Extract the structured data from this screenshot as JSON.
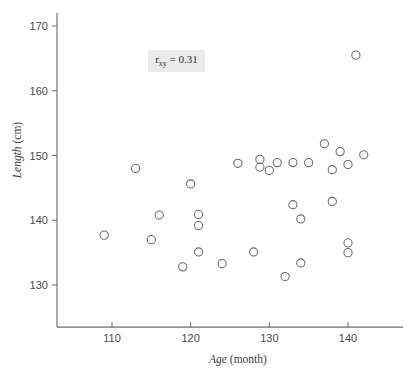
{
  "chart_data": {
    "type": "scatter",
    "title": "",
    "xlabel": "Age (month)",
    "xlabel_italic_part": "Age",
    "xlabel_rest": " (month)",
    "ylabel": "Length (cm)",
    "ylabel_italic_part": "Length",
    "ylabel_rest": " (cm)",
    "xlim": [
      103,
      147
    ],
    "ylim": [
      123.5,
      172
    ],
    "xticks": [
      110,
      120,
      130,
      140
    ],
    "yticks": [
      130,
      140,
      150,
      160,
      170
    ],
    "xtick_labels": [
      "110",
      "120",
      "130",
      "140"
    ],
    "ytick_labels": [
      "130",
      "140",
      "150",
      "160",
      "170"
    ],
    "grid": false,
    "legend": false,
    "marker": "open-circle",
    "marker_color": "#6b6b6b",
    "points": [
      {
        "x": 109.0,
        "y": 137.7
      },
      {
        "x": 113.0,
        "y": 148.0
      },
      {
        "x": 115.0,
        "y": 137.0
      },
      {
        "x": 116.0,
        "y": 140.8
      },
      {
        "x": 119.0,
        "y": 132.8
      },
      {
        "x": 120.0,
        "y": 145.6
      },
      {
        "x": 121.0,
        "y": 140.9
      },
      {
        "x": 121.0,
        "y": 139.2
      },
      {
        "x": 121.0,
        "y": 135.1
      },
      {
        "x": 124.0,
        "y": 133.3
      },
      {
        "x": 126.0,
        "y": 148.8
      },
      {
        "x": 128.0,
        "y": 135.1
      },
      {
        "x": 128.8,
        "y": 149.4
      },
      {
        "x": 128.8,
        "y": 148.2
      },
      {
        "x": 130.0,
        "y": 147.7
      },
      {
        "x": 131.0,
        "y": 148.9
      },
      {
        "x": 132.0,
        "y": 131.3
      },
      {
        "x": 133.0,
        "y": 142.4
      },
      {
        "x": 133.0,
        "y": 148.9
      },
      {
        "x": 134.0,
        "y": 140.2
      },
      {
        "x": 134.0,
        "y": 133.4
      },
      {
        "x": 135.0,
        "y": 148.9
      },
      {
        "x": 137.0,
        "y": 151.8
      },
      {
        "x": 138.0,
        "y": 142.9
      },
      {
        "x": 138.0,
        "y": 147.8
      },
      {
        "x": 139.0,
        "y": 150.6
      },
      {
        "x": 140.0,
        "y": 148.6
      },
      {
        "x": 140.0,
        "y": 136.5
      },
      {
        "x": 140.0,
        "y": 135.0
      },
      {
        "x": 141.0,
        "y": 165.5
      },
      {
        "x": 142.0,
        "y": 150.1
      }
    ],
    "annotation": {
      "prefix": "r",
      "subscript": "xy",
      "suffix": " = 0.31",
      "full_text": "r xy = 0.31",
      "value": 0.31,
      "background_color": "#ebebeb"
    }
  }
}
